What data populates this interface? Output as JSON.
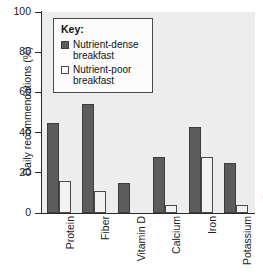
{
  "chart_data": {
    "type": "bar",
    "title": "",
    "xlabel": "",
    "ylabel": "Daily recommendations (%)",
    "ylim": [
      0,
      100
    ],
    "yticks": [
      0,
      20,
      40,
      60,
      80,
      100
    ],
    "ytick_labels": [
      "0",
      "20",
      "40",
      "60",
      "80",
      "100"
    ],
    "grid": false,
    "legend_position": "upper-left-inside",
    "legend_title": "Key:",
    "categories": [
      "Protein",
      "Fiber",
      "Vitamin D",
      "Calcium",
      "Iron",
      "Potassium"
    ],
    "series": [
      {
        "name": "Nutrient-dense breakfast",
        "color": "#5c5c5c",
        "values": [
          45,
          54,
          15,
          28,
          43,
          25
        ]
      },
      {
        "name": "Nutrient-poor breakfast",
        "color": "#f2f2f2",
        "values": [
          16,
          11,
          0,
          4,
          28,
          4
        ]
      }
    ]
  },
  "legend": {
    "title": "Key:",
    "entries": [
      {
        "label_line1": "Nutrient-dense",
        "label_line2": "breakfast",
        "swatch": "dense"
      },
      {
        "label_line1": "Nutrient-poor",
        "label_line2": "breakfast",
        "swatch": "poor"
      }
    ]
  },
  "credit": {
    "text": "© Source"
  }
}
